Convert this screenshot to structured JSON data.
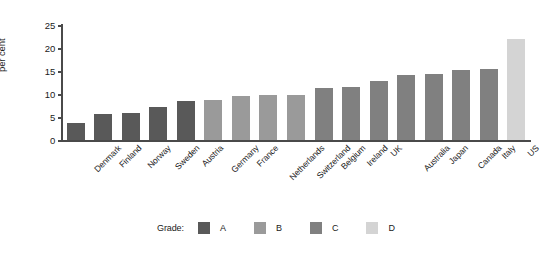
{
  "chart_data": {
    "type": "bar",
    "title": "",
    "xlabel": "",
    "ylabel": "per cent",
    "ylim": [
      0,
      25
    ],
    "yticks": [
      0,
      5,
      10,
      15,
      20,
      25
    ],
    "grid": false,
    "legend_position": "bottom-center",
    "legend_title": "Grade:",
    "categories": [
      "Denmark",
      "Finland",
      "Norway",
      "Sweden",
      "Austria",
      "Germany",
      "France",
      "Netherlands",
      "Switzerland",
      "Belgium",
      "Ireland",
      "UK",
      "Australia",
      "Japan",
      "Canada",
      "Italy",
      "US"
    ],
    "values": [
      3.8,
      5.6,
      5.8,
      7.1,
      8.4,
      8.7,
      9.6,
      9.7,
      9.8,
      11.4,
      11.6,
      12.8,
      14.2,
      14.4,
      15.3,
      15.4,
      22.0
    ],
    "groups": [
      "A",
      "A",
      "A",
      "A",
      "A",
      "B",
      "B",
      "B",
      "B",
      "C",
      "C",
      "C",
      "C",
      "C",
      "C",
      "C",
      "D"
    ],
    "series": [
      {
        "name": "A",
        "color": "#595959"
      },
      {
        "name": "B",
        "color": "#9a9a9a"
      },
      {
        "name": "C",
        "color": "#808080"
      },
      {
        "name": "D",
        "color": "#d4d4d4"
      }
    ]
  },
  "legend": {
    "title": "Grade:",
    "items": [
      {
        "label": "A",
        "color": "#595959"
      },
      {
        "label": "B",
        "color": "#9a9a9a"
      },
      {
        "label": "C",
        "color": "#808080"
      },
      {
        "label": "D",
        "color": "#d4d4d4"
      }
    ]
  }
}
